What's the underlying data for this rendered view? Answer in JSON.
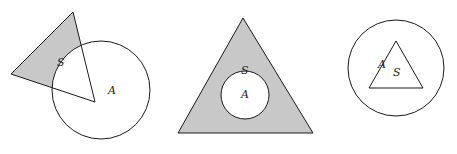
{
  "figures": [
    {
      "id": "fig-left",
      "description": "Triangle S overlapping circle A, one vertex at circle center; shaded region is part of S outside A",
      "labels": {
        "s": "S",
        "a": "A"
      }
    },
    {
      "id": "fig-middle",
      "description": "Circle A inside triangle S; shaded region is S minus A",
      "labels": {
        "s": "S",
        "a": "A"
      }
    },
    {
      "id": "fig-right",
      "description": "Triangle S inside circle A; no shading",
      "labels": {
        "s": "S",
        "a": "A"
      }
    }
  ],
  "colors": {
    "fill": "#c8c8c8",
    "stroke": "#1a1a1a",
    "background": "#ffffff"
  }
}
